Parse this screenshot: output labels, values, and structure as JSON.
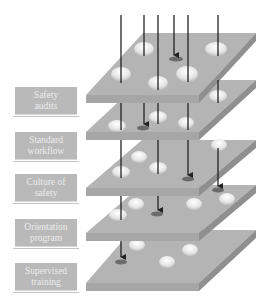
{
  "diagram": {
    "type": "swiss-cheese-model",
    "layers": [
      {
        "label_line1": "Safety",
        "label_line2": "audits"
      },
      {
        "label_line1": "Standard",
        "label_line2": "workflow"
      },
      {
        "label_line1": "Culture of",
        "label_line2": "safety"
      },
      {
        "label_line1": "Orientation",
        "label_line2": "program"
      },
      {
        "label_line1": "Supervised",
        "label_line2": "training"
      }
    ],
    "colors": {
      "slab_top": "#b4b4b4",
      "slab_front": "#a6a6a6",
      "slab_side": "#8f8f8f",
      "label_bg": "#b9b9b9",
      "label_text": "#ececec",
      "hole": "#e8e8e8",
      "arrow": "#222222",
      "stop_mark": "#666666"
    }
  }
}
